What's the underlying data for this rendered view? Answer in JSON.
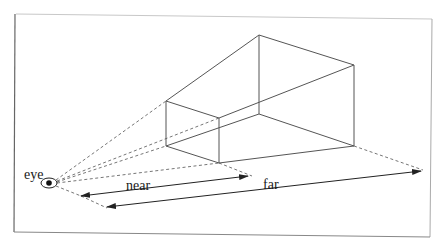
{
  "diagram": {
    "labels": {
      "eye": "eye",
      "near": "near",
      "far": "far"
    },
    "colors": {
      "line": "#555555",
      "dashed": "#666666",
      "frame_left_bottom": "#777777",
      "frame_top_right": "#bbbbbb",
      "text": "#1a1a1a"
    },
    "nodes": {
      "eye": {
        "x": 49,
        "y": 183
      },
      "near_plane": {
        "top_left": {
          "x": 166,
          "y": 101
        },
        "top_right": {
          "x": 219,
          "y": 118
        },
        "bottom_left": {
          "x": 166,
          "y": 146
        },
        "bottom_right": {
          "x": 219,
          "y": 163
        }
      },
      "far_plane": {
        "top_left": {
          "x": 259,
          "y": 35
        },
        "top_right": {
          "x": 354,
          "y": 65
        },
        "bottom_left": {
          "x": 259,
          "y": 114
        },
        "bottom_right": {
          "x": 354,
          "y": 146
        }
      }
    },
    "arrows": [
      {
        "name": "near",
        "from": {
          "x": 81,
          "y": 196
        },
        "to": {
          "x": 248,
          "y": 176
        }
      },
      {
        "name": "far",
        "from": {
          "x": 107,
          "y": 207
        },
        "to": {
          "x": 421,
          "y": 171
        }
      }
    ]
  }
}
